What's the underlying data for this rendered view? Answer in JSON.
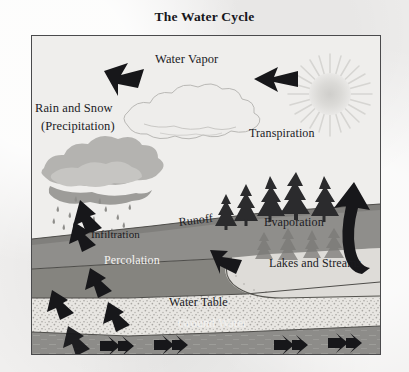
{
  "title": "The Water Cycle",
  "frame": {
    "x": 31,
    "y": 35,
    "width": 350,
    "height": 320
  },
  "colors": {
    "paper": "#f0efee",
    "ink": "#1b1b1f",
    "frame_border": "#4a4a4c",
    "sky": "#efeeed",
    "sun": "#d9d8d6",
    "cloud_vapor_outline": "#b9b8b6",
    "cloud_rain_fill": "#b2b1ae",
    "cloud_rain_shade": "#9b9a97",
    "soil_band": "#8e8d8a",
    "soil_band_dark": "#7e7d7a",
    "lake_light": "#dedcd8",
    "stipple_light": "#e6e4e0",
    "ground_water": "#8d8c89",
    "tree_dark": "#2b2b2d",
    "tree_shadow": "#6f6e6b",
    "arrow_black": "#161617"
  },
  "labels": [
    {
      "id": "water-vapor",
      "text": "Water Vapor",
      "x": 155,
      "y": 52,
      "size": 12.5,
      "style": "dark"
    },
    {
      "id": "rain-and-snow",
      "text": "Rain and Snow",
      "x": 35,
      "y": 101,
      "size": 12.5,
      "style": "dark"
    },
    {
      "id": "precipitation",
      "text": "(Precipitation)",
      "x": 41,
      "y": 119,
      "size": 12.5,
      "style": "dark"
    },
    {
      "id": "transpiration",
      "text": "Transpiration",
      "x": 249,
      "y": 127,
      "size": 12.0,
      "style": "dark"
    },
    {
      "id": "infiltration",
      "text": "Infiltration",
      "x": 91,
      "y": 228,
      "size": 11.0,
      "style": "dark"
    },
    {
      "id": "runoff",
      "text": "Runoff",
      "x": 178,
      "y": 216,
      "size": 12.0,
      "style": "dark"
    },
    {
      "id": "evaporation",
      "text": "Evaporation",
      "x": 264,
      "y": 216,
      "size": 12.0,
      "style": "dark"
    },
    {
      "id": "percolation",
      "text": "Percolation",
      "x": 104,
      "y": 254,
      "size": 12.0,
      "style": "white"
    },
    {
      "id": "lakes-and-streams",
      "text": "Lakes and Streams",
      "x": 269,
      "y": 257,
      "size": 12.0,
      "style": "dark"
    },
    {
      "id": "water-table",
      "text": "Water Table",
      "x": 169,
      "y": 296,
      "size": 12.0,
      "style": "dark"
    },
    {
      "id": "ground-water",
      "text": "Ground Water",
      "x": 178,
      "y": 317,
      "size": 12.0,
      "style": "white"
    }
  ],
  "scene_elements": [
    {
      "id": "sun",
      "name": "sun-icon",
      "description": "light gray radiating starburst sun, upper right sky"
    },
    {
      "id": "vapor-cloud",
      "name": "water-vapor-cloud-icon",
      "description": "outlined cloud in center sky"
    },
    {
      "id": "rain-cloud",
      "name": "rain-cloud-icon",
      "description": "filled gray cloud with falling rain droplets, left"
    },
    {
      "id": "arrow-to-cloud",
      "name": "precipitation-arrow-icon",
      "description": "thick black arrow pointing down-left toward rain cloud"
    },
    {
      "id": "arrow-vapor-left",
      "name": "water-vapor-arrow-icon",
      "description": "thick black arrow pointing left toward vapor cloud"
    },
    {
      "id": "arrow-rain-down",
      "name": "rainfall-arrow-icon",
      "description": "black arrow pointing down out of rain cloud"
    },
    {
      "id": "arrow-evaporation",
      "name": "evaporation-arrow-icon",
      "description": "large curved black arrow rising from lake at right"
    },
    {
      "id": "arrows-infiltration",
      "name": "infiltration-arrow-icon",
      "description": "black arrows descending through soil layers at left"
    },
    {
      "id": "arrow-runoff",
      "name": "runoff-arrow-icon",
      "description": "black arrow pointing down-right into the lake"
    },
    {
      "id": "arrows-groundwater",
      "name": "groundwater-flow-arrow-icon",
      "description": "row of black arrows flowing right inside ground water band"
    },
    {
      "id": "trees",
      "name": "pine-trees-icon",
      "description": "row of pine trees on the right hillside"
    },
    {
      "id": "lake",
      "name": "lake-shape",
      "description": "light rounded lake basin at center right"
    },
    {
      "id": "soil-layers",
      "name": "soil-layers",
      "description": "stacked gray soil and stippled aquifer bands"
    }
  ]
}
